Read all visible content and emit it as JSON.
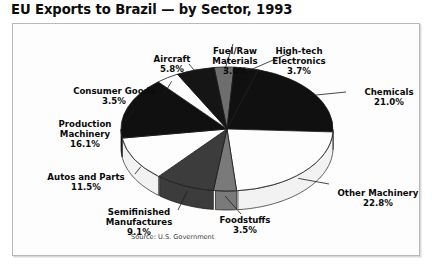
{
  "title": "EU Exports to Brazil — by Sector, 1993",
  "source_note": "Source: U.S. Government",
  "chart_data": {
    "type": "pie",
    "title": "EU Exports to Brazil — by Sector, 1993",
    "subtitle": "",
    "xlabel": "",
    "ylabel": "",
    "units": "percent",
    "legend_position": "none",
    "labels_outside": true,
    "start_angle_deg": 353,
    "direction": "clockwise",
    "three_d": true,
    "categories": [
      "Fuel/Raw Materials",
      "High-tech Electronics",
      "Chemicals",
      "Other Machinery",
      "Foodstuffs",
      "Semifinished Manufactures",
      "Autos and Parts",
      "Production Machinery",
      "Consumer Goods",
      "Aircraft"
    ],
    "values": [
      3.0,
      3.7,
      21.0,
      22.8,
      3.5,
      9.1,
      11.5,
      16.1,
      3.5,
      5.8
    ],
    "value_labels": [
      "3.0%",
      "3.7%",
      "21.0%",
      "22.8%",
      "3.5%",
      "9.1%",
      "11.5%",
      "16.1%",
      "3.5%",
      "5.8%"
    ],
    "slice_colors": [
      "#6e6e6e",
      "#101010",
      "#101010",
      "#fdfdfd",
      "#7a7a7a",
      "#3c3c3c",
      "#fdfdfd",
      "#101010",
      "#fdfdfd",
      "#151515"
    ],
    "slices": [
      {
        "name": "Fuel/Raw Materials",
        "value": 3.0,
        "label": "Fuel/Raw\nMaterials",
        "pct": "3.0%",
        "color": "#6e6e6e"
      },
      {
        "name": "High-tech Electronics",
        "value": 3.7,
        "label": "High-tech\nElectronics",
        "pct": "3.7%",
        "color": "#101010"
      },
      {
        "name": "Chemicals",
        "value": 21.0,
        "label": "Chemicals",
        "pct": "21.0%",
        "color": "#101010"
      },
      {
        "name": "Other Machinery",
        "value": 22.8,
        "label": "Other Machinery",
        "pct": "22.8%",
        "color": "#fdfdfd"
      },
      {
        "name": "Foodstuffs",
        "value": 3.5,
        "label": "Foodstuffs",
        "pct": "3.5%",
        "color": "#7a7a7a"
      },
      {
        "name": "Semifinished Manufactures",
        "value": 9.1,
        "label": "Semifinished\nManufactures",
        "pct": "9.1%",
        "color": "#3c3c3c"
      },
      {
        "name": "Autos and Parts",
        "value": 11.5,
        "label": "Autos and Parts",
        "pct": "11.5%",
        "color": "#fdfdfd"
      },
      {
        "name": "Production Machinery",
        "value": 16.1,
        "label": "Production\nMachinery",
        "pct": "16.1%",
        "color": "#101010"
      },
      {
        "name": "Consumer Goods",
        "value": 3.5,
        "label": "Consumer Goods",
        "pct": "3.5%",
        "color": "#fdfdfd"
      },
      {
        "name": "Aircraft",
        "value": 5.8,
        "label": "Aircraft",
        "pct": "5.8%",
        "color": "#151515"
      }
    ],
    "total": 100.0
  },
  "labels": {
    "aircraft": {
      "name": "Aircraft",
      "pct": "5.8%"
    },
    "fuelraw_l1": "Fuel/Raw",
    "fuelraw_l2": "Materials",
    "fuelraw_pct": "3.0%",
    "hightech_l1": "High-tech",
    "hightech_l2": "Electronics",
    "hightech_pct": "3.7%",
    "chemicals": {
      "name": "Chemicals",
      "pct": "21.0%"
    },
    "othermach": {
      "name": "Other Machinery",
      "pct": "22.8%"
    },
    "foodstuffs": {
      "name": "Foodstuffs",
      "pct": "3.5%"
    },
    "semifin_l1": "Semifinished",
    "semifin_l2": "Manufactures",
    "semifin_pct": "9.1%",
    "autos": {
      "name": "Autos and Parts",
      "pct": "11.5%"
    },
    "production_l1": "Production",
    "production_l2": "Machinery",
    "production_pct": "16.1%",
    "consumer": {
      "name": "Consumer Goods",
      "pct": "3.5%"
    }
  }
}
